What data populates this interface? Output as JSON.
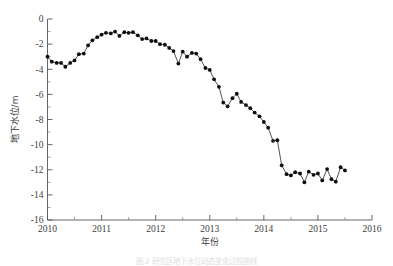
{
  "figure": {
    "caption": "图 2 研究区地下水位动态变化过程曲线",
    "colors": {
      "line": "#1a1a1a",
      "marker": "#0d0d0d",
      "axis": "#555555",
      "background": "#ffffff"
    }
  },
  "chart_data": {
    "type": "line",
    "title": "",
    "xlabel": "年份",
    "ylabel": "地下水位/m",
    "xlim": [
      2010,
      2016
    ],
    "ylim": [
      -16,
      0
    ],
    "xticks": [
      2010,
      2011,
      2012,
      2013,
      2014,
      2015,
      2016
    ],
    "xticklabels": [
      "2010",
      "2011",
      "2012",
      "2013",
      "2014",
      "2015",
      "2016"
    ],
    "yticks": [
      0,
      -2,
      -4,
      -6,
      -8,
      -10,
      -12,
      -14,
      -16
    ],
    "yticklabels": [
      "0",
      "-2",
      "-4",
      "-6",
      "-8",
      "-10",
      "-12",
      "-14",
      "-16"
    ],
    "xminor_per_major": 2,
    "yminor_per_major": 2,
    "grid": false,
    "legend": null,
    "marker": "filled-circle",
    "series": [
      {
        "name": "地下水位",
        "x": [
          2010.0,
          2010.08,
          2010.17,
          2010.25,
          2010.33,
          2010.42,
          2010.5,
          2010.58,
          2010.67,
          2010.75,
          2010.83,
          2010.92,
          2011.0,
          2011.08,
          2011.17,
          2011.25,
          2011.33,
          2011.42,
          2011.5,
          2011.58,
          2011.67,
          2011.75,
          2011.83,
          2011.92,
          2012.0,
          2012.08,
          2012.17,
          2012.25,
          2012.33,
          2012.42,
          2012.5,
          2012.58,
          2012.67,
          2012.75,
          2012.83,
          2012.92,
          2013.0,
          2013.08,
          2013.17,
          2013.25,
          2013.33,
          2013.42,
          2013.5,
          2013.58,
          2013.67,
          2013.75,
          2013.83,
          2013.92,
          2014.0,
          2014.08,
          2014.17,
          2014.25,
          2014.33,
          2014.42,
          2014.5,
          2014.58,
          2014.67,
          2014.75,
          2014.83,
          2014.92,
          2015.0,
          2015.08,
          2015.17,
          2015.25,
          2015.33,
          2015.42,
          2015.5
        ],
        "values": [
          -3.0,
          -3.4,
          -3.5,
          -3.5,
          -3.8,
          -3.5,
          -3.3,
          -2.8,
          -2.75,
          -2.1,
          -1.7,
          -1.45,
          -1.25,
          -1.1,
          -1.15,
          -1.0,
          -1.35,
          -1.05,
          -1.1,
          -1.05,
          -1.3,
          -1.6,
          -1.55,
          -1.75,
          -1.75,
          -2.0,
          -2.05,
          -2.3,
          -2.55,
          -3.55,
          -2.6,
          -3.0,
          -2.7,
          -2.75,
          -3.2,
          -3.9,
          -4.05,
          -4.8,
          -5.4,
          -6.65,
          -6.95,
          -6.3,
          -5.95,
          -6.6,
          -6.85,
          -7.1,
          -7.45,
          -7.75,
          -8.2,
          -8.65,
          -9.7,
          -9.65,
          -11.65,
          -12.35,
          -12.45,
          -12.2,
          -12.3,
          -13.0,
          -12.15,
          -12.4,
          -12.3,
          -12.85,
          -11.95,
          -12.75,
          -12.95,
          -11.8,
          -12.05
        ]
      }
    ]
  }
}
